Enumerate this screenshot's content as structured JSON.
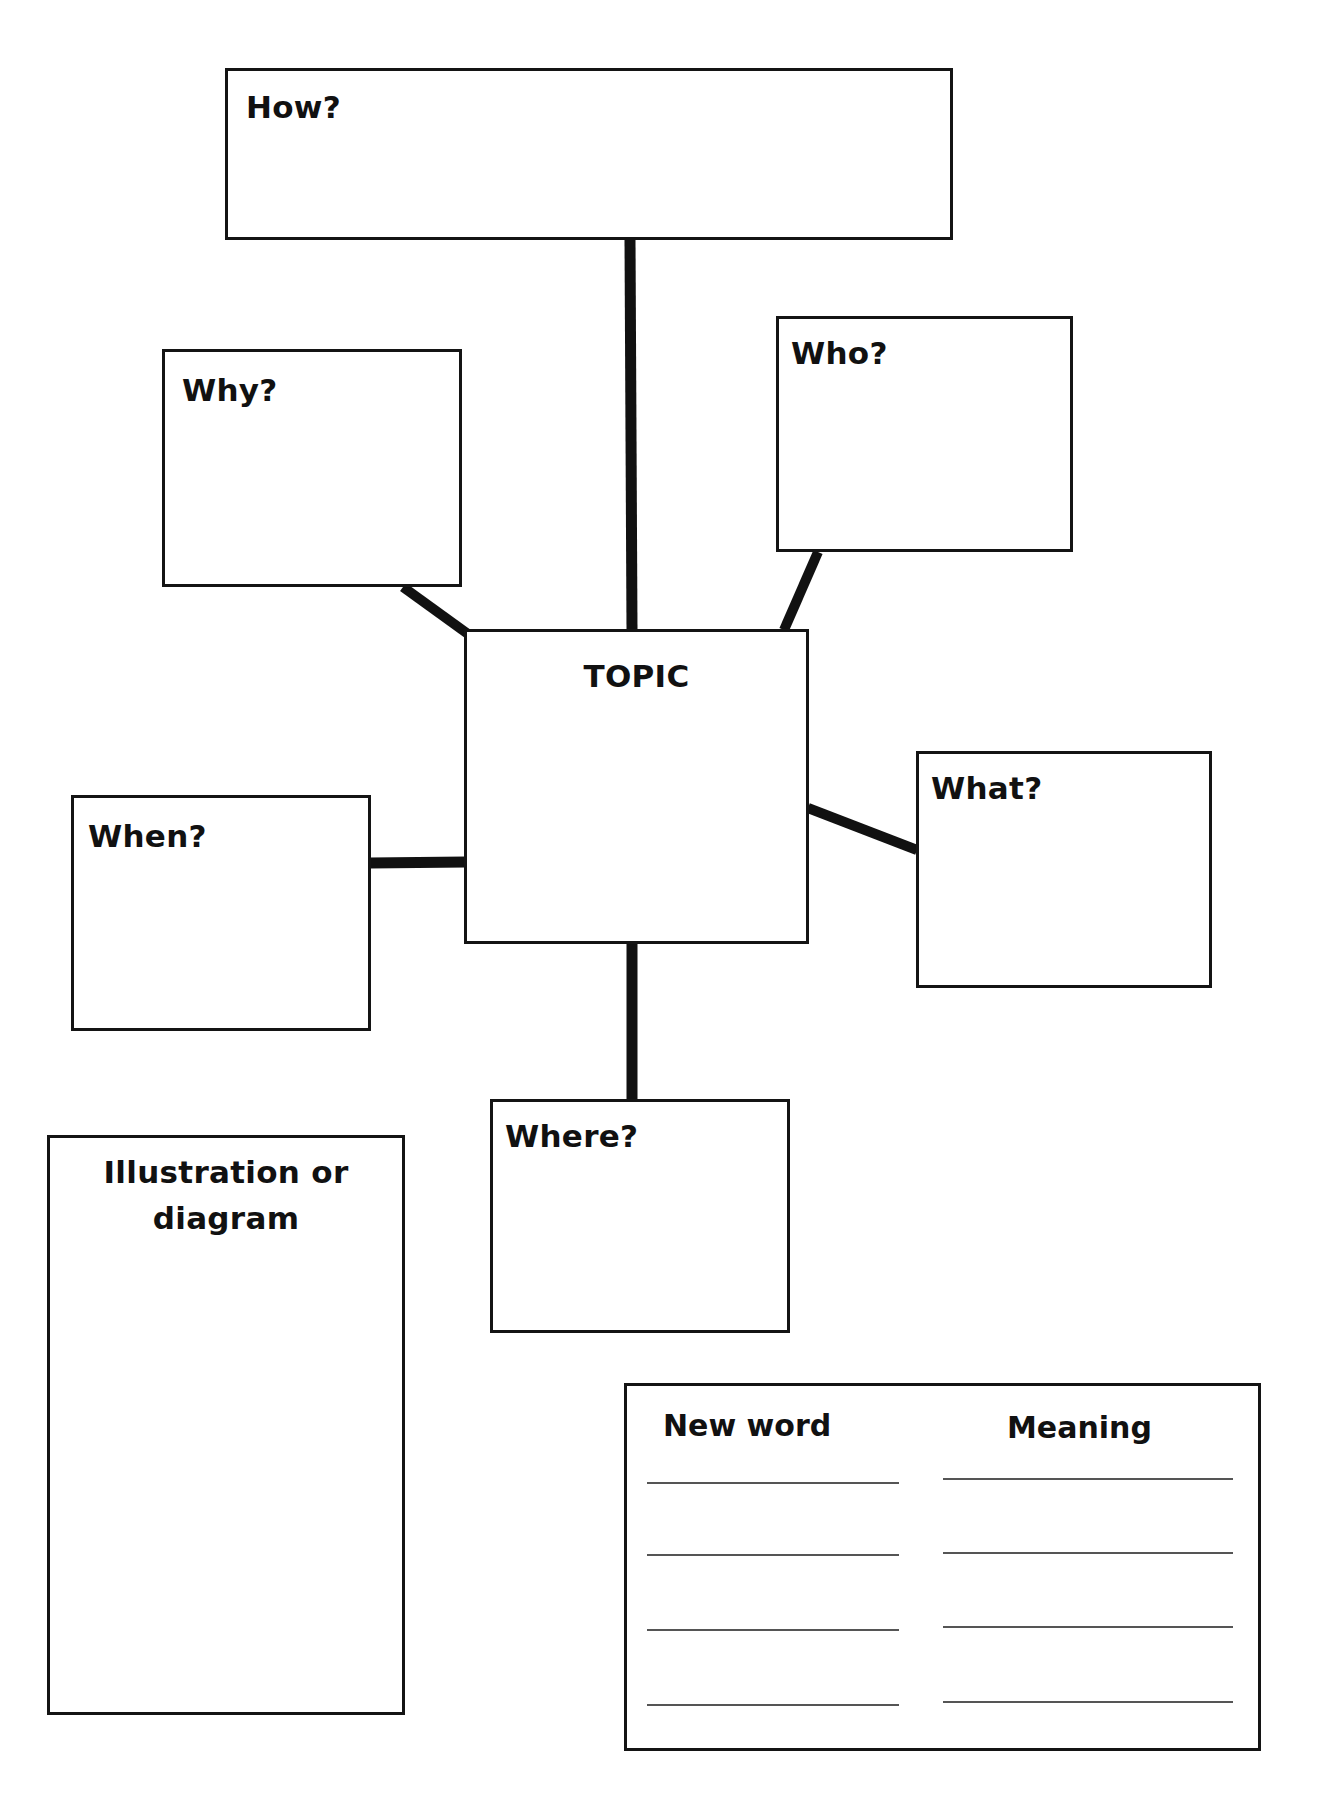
{
  "worksheet": {
    "boxes": {
      "how": {
        "label": "How?"
      },
      "why": {
        "label": "Why?"
      },
      "who": {
        "label": "Who?"
      },
      "topic": {
        "label": "TOPIC"
      },
      "when": {
        "label": "When?"
      },
      "what": {
        "label": "What?"
      },
      "where": {
        "label": "Where?"
      },
      "illustration": {
        "label_line1": "Illustration or",
        "label_line2": "diagram"
      }
    },
    "vocabulary": {
      "columns": [
        "New word",
        "Meaning"
      ],
      "rows": 4
    },
    "colors": {
      "ink": "#141414",
      "paper": "#ffffff",
      "rule": "#555555"
    }
  }
}
